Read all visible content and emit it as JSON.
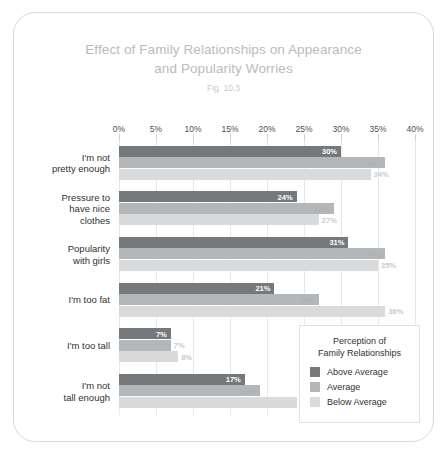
{
  "chart_data": {
    "type": "bar",
    "orientation": "horizontal",
    "title": "Effect of Family Relationships on Appearance and Popularity Worries",
    "title_line1": "Effect of Family Relationships on Appearance",
    "title_line2": "and Popularity Worries",
    "subtitle": "Fig. 10.3",
    "xlabel": "",
    "ylabel": "",
    "xlim": [
      0,
      40
    ],
    "grid": true,
    "legend_position": "inside-bottom-right",
    "legend_title": "Perception of\nFamily Relationships",
    "tick_labels": [
      "0%",
      "5%",
      "10%",
      "15%",
      "20%",
      "25%",
      "30%",
      "35%",
      "40%"
    ],
    "tick_values": [
      0,
      5,
      10,
      15,
      20,
      25,
      30,
      35,
      40
    ],
    "categories": [
      "I'm not\npretty enough",
      "Pressure to\nhave nice\nclothes",
      "Popularity\nwith girls",
      "I'm too fat",
      "I'm too tall",
      "I'm not\ntall enough"
    ],
    "series": [
      {
        "name": "Above Average",
        "color": "#76797c",
        "values": [
          30,
          24,
          31,
          21,
          7,
          17
        ],
        "labels": [
          "30%",
          "24%",
          "31%",
          "21%",
          "7%",
          "17%"
        ]
      },
      {
        "name": "Average",
        "color": "#b4b7ba",
        "values": [
          36,
          29,
          36,
          27,
          7,
          19
        ],
        "labels": [
          "36%",
          "29%",
          "36%",
          "27%",
          "7%",
          "19%"
        ]
      },
      {
        "name": "Below Average",
        "color": "#d8dadb",
        "values": [
          34,
          27,
          35,
          36,
          8,
          24
        ],
        "labels": [
          "34%",
          "27%",
          "35%",
          "36%",
          "8%",
          "24%"
        ]
      }
    ]
  }
}
